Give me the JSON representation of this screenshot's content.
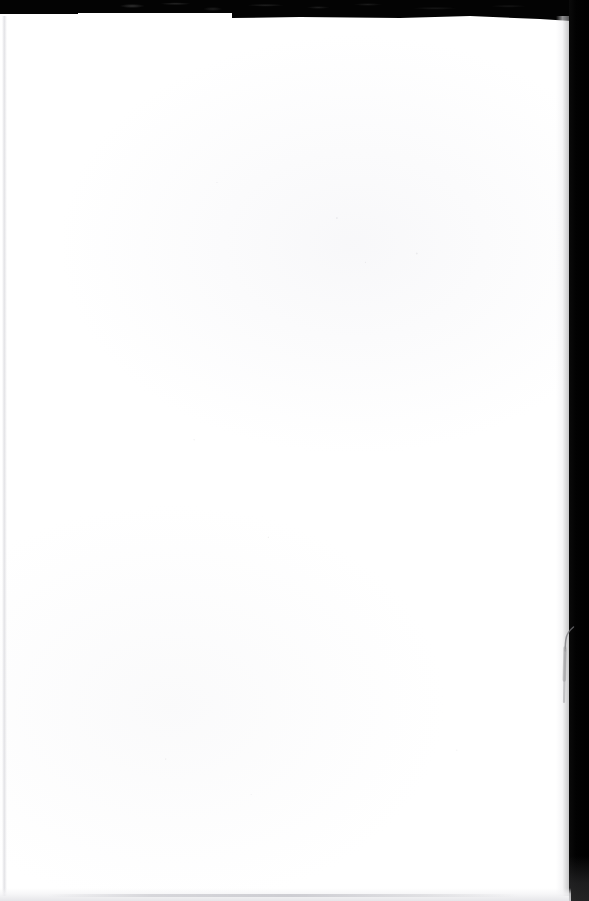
{
  "document": {
    "kind": "scanned-page",
    "page_text": "",
    "page_background_color": "#ffffff",
    "scanner_background_color": "#000000",
    "orientation": "portrait",
    "is_blank": true
  },
  "artifacts": {
    "top_band_label": "scanner-lid-band",
    "right_band_label": "scanner-lid-band",
    "hair_label": "hair-fiber-artifact",
    "bottom_shadow_label": "page-edge-shadow",
    "left_shadow_label": "page-edge-shadow"
  }
}
